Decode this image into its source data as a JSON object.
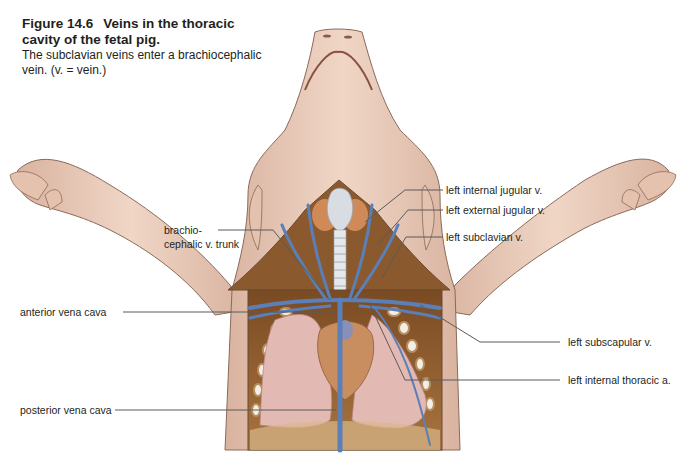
{
  "figure": {
    "number": "Figure 14.6",
    "title": "Veins in the thoracic cavity of the fetal pig.",
    "description": "The subclavian veins enter a brachiocephalic vein. (v. = vein.)"
  },
  "labels": {
    "left_internal_jugular": "left internal jugular v.",
    "left_external_jugular": "left external jugular v.",
    "left_subclavian": "left subclavian v.",
    "brachiocephalic_line1": "brachio-",
    "brachiocephalic_line2": "cephalic v. trunk",
    "anterior_vena_cava": "anterior vena cava",
    "left_subscapular": "left subscapular v.",
    "left_internal_thoracic": "left internal thoracic a.",
    "posterior_vena_cava": "posterior vena cava"
  },
  "colors": {
    "skin": "#e8c9b6",
    "skin_shadow": "#cfa592",
    "outline": "#8a6a5a",
    "muscle": "#8a5a2e",
    "vein": "#5b7fb8",
    "lung": "#e3b9b3",
    "heart": "#c98e5f",
    "trachea": "#d8dde3",
    "thymus": "#d08a58",
    "leader": "#5a5a5a"
  }
}
